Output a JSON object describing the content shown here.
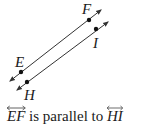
{
  "diagram": {
    "lines": [
      {
        "name": "EF",
        "points": [
          {
            "label": "E"
          },
          {
            "label": "F"
          }
        ]
      },
      {
        "name": "HI",
        "points": [
          {
            "label": "H"
          },
          {
            "label": "I"
          }
        ]
      }
    ],
    "caption": {
      "line1": "EF",
      "text": " is parallel to ",
      "line2": "HI"
    },
    "colors": {
      "line": "#333333",
      "text": "#1a1a1a"
    }
  }
}
